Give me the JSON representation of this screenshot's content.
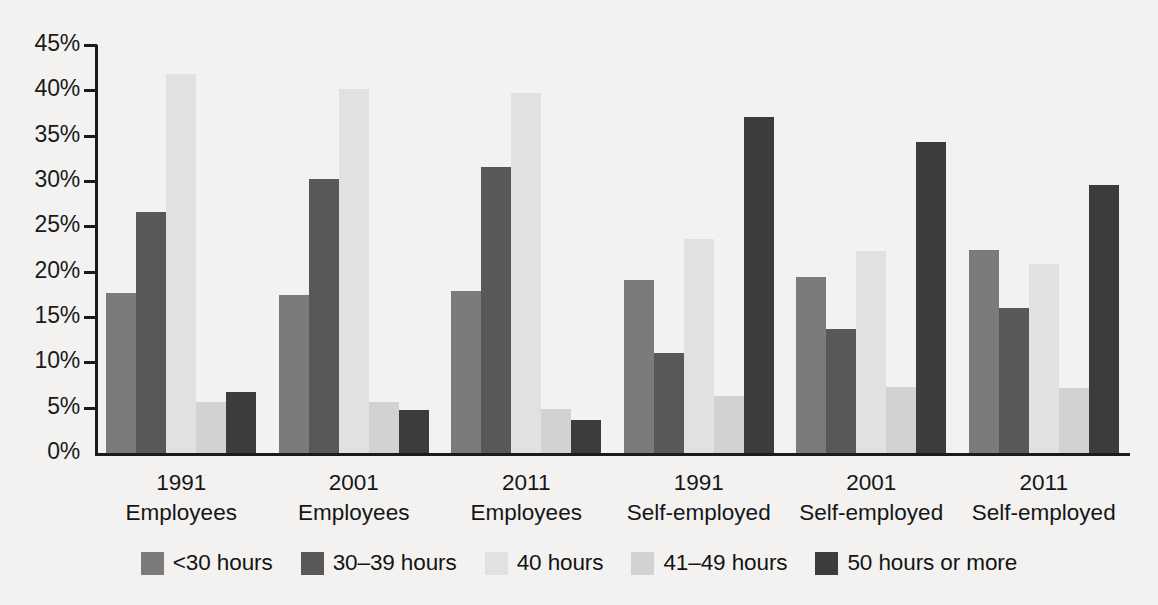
{
  "chart_data": {
    "type": "bar",
    "title": "",
    "subtitle": "",
    "xlabel": "",
    "ylabel": "",
    "ylim": [
      0,
      45
    ],
    "ytick_step": 5,
    "ytick_labels": [
      "0%",
      "5%",
      "10%",
      "15%",
      "20%",
      "25%",
      "30%",
      "35%",
      "40%",
      "45%"
    ],
    "ytick_values": [
      0,
      5,
      10,
      15,
      20,
      25,
      30,
      35,
      40,
      45
    ],
    "grid": false,
    "legend_position": "bottom",
    "categories": [
      {
        "year": "1991",
        "group": "Employees"
      },
      {
        "year": "2001",
        "group": "Employees"
      },
      {
        "year": "2011",
        "group": "Employees"
      },
      {
        "year": "1991",
        "group": "Self-employed"
      },
      {
        "year": "2001",
        "group": "Self-employed"
      },
      {
        "year": "2011",
        "group": "Self-employed"
      }
    ],
    "category_labels": [
      "1991 Employees",
      "2001 Employees",
      "2011 Employees",
      "1991 Self-employed",
      "2001 Self-employed",
      "2011 Self-employed"
    ],
    "series": [
      {
        "name": "<30 hours",
        "color": "#7b7b7b",
        "values": [
          17.7,
          17.4,
          17.9,
          19.1,
          19.4,
          22.4
        ]
      },
      {
        "name": "30–39 hours",
        "color": "#585858",
        "values": [
          26.6,
          30.2,
          31.5,
          11.0,
          13.7,
          16.0
        ]
      },
      {
        "name": "40 hours",
        "color": "#e2e1df",
        "values": [
          41.8,
          40.2,
          39.7,
          23.6,
          22.3,
          20.9
        ]
      },
      {
        "name": "41–49 hours",
        "color": "#d3d2d0",
        "values": [
          5.6,
          5.6,
          4.8,
          6.3,
          7.3,
          7.2
        ]
      },
      {
        "name": "50 hours or more",
        "color": "#3c3c3c",
        "values": [
          6.7,
          4.7,
          3.6,
          37.1,
          34.3,
          29.6
        ]
      }
    ],
    "legend": [
      {
        "label": "<30 hours",
        "color": "#7b7b7b"
      },
      {
        "label": "30–39 hours",
        "color": "#585858"
      },
      {
        "label": "40 hours",
        "color": "#e2e1df"
      },
      {
        "label": "41–49 hours",
        "color": "#d3d2d0"
      },
      {
        "label": "50 hours or more",
        "color": "#3c3c3c"
      }
    ],
    "axis_color": "#1b1b1b",
    "background_color": "#f3f2f0"
  }
}
